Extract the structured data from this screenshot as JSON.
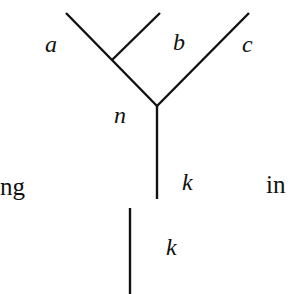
{
  "diagram": {
    "type": "trivalent-tree-fusion",
    "stroke_color": "#111111",
    "labels": {
      "a": "a",
      "b": "b",
      "c": "c",
      "n": "n",
      "k_top": "k",
      "k_bottom": "k",
      "left_text": "ng",
      "right_text": "in"
    },
    "edges": [
      {
        "name": "edge-a",
        "from": [
          66,
          13
        ],
        "to": [
          157,
          106
        ]
      },
      {
        "name": "edge-b",
        "from": [
          160,
          13
        ],
        "to": [
          112,
          60
        ]
      },
      {
        "name": "edge-c",
        "from": [
          249,
          13
        ],
        "to": [
          157,
          106
        ]
      },
      {
        "name": "edge-k-top",
        "from": [
          157,
          106
        ],
        "to": [
          157,
          199
        ]
      },
      {
        "name": "edge-k-bottom",
        "from": [
          130,
          208
        ],
        "to": [
          130,
          294
        ]
      }
    ]
  }
}
